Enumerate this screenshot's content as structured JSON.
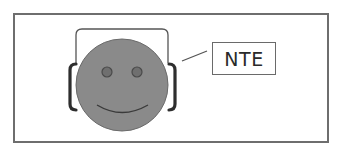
{
  "figure": {
    "label": "NTE",
    "colors": {
      "frame_border": "#6e6e6e",
      "face_fill": "#8a8a8a",
      "face_outline": "#6a6a6a",
      "eye_fill": "#6f6f6f",
      "eye_outline": "#4a4a4a",
      "smile_stroke": "#3a3a3a",
      "headband_stroke": "#555555",
      "ear_cup_stroke": "#2e2e2e",
      "leader_line": "#555555",
      "label_border": "#6a6a6a",
      "label_text": "#2a2a2a"
    },
    "elements": {
      "face": {
        "shape": "circle",
        "cx": 122,
        "cy": 85,
        "r": 46
      },
      "left_eye": {
        "shape": "circle",
        "cx": 107,
        "cy": 72,
        "r": 5
      },
      "right_eye": {
        "shape": "circle",
        "cx": 137,
        "cy": 72,
        "r": 5
      },
      "smile": {
        "shape": "arc"
      },
      "headband": {
        "shape": "arch"
      },
      "left_ear_cup": {
        "shape": "bracket"
      },
      "right_ear_cup": {
        "shape": "bracket"
      },
      "leader_line": {
        "from": [
          182,
          61
        ],
        "to": [
          207,
          51
        ]
      }
    }
  }
}
